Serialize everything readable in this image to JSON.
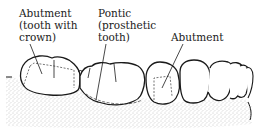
{
  "diagram": {
    "labels": {
      "abutment_left": {
        "lines": [
          "Abutment",
          "(tooth with",
          "crown)"
        ]
      },
      "pontic": {
        "lines": [
          "Pontic",
          "(prosthetic",
          "tooth)"
        ]
      },
      "abutment_right": {
        "lines": [
          "Abutment"
        ]
      }
    },
    "colors": {
      "line": "#1a1a1a",
      "gum_stipple": "#9a9a9a",
      "background": "#ffffff"
    }
  }
}
